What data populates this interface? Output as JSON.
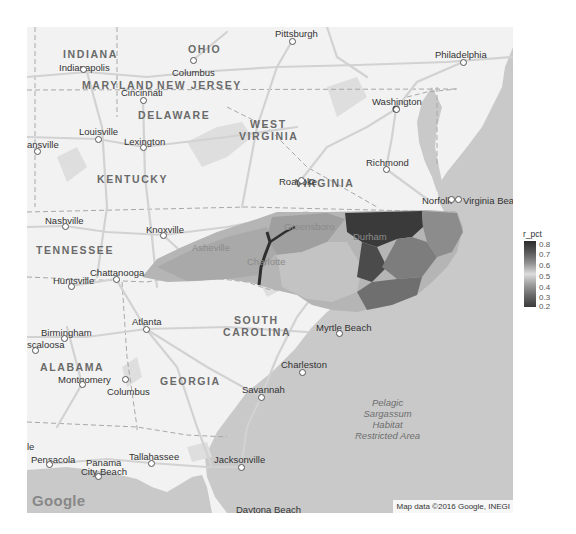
{
  "map": {
    "provider_logo": "Google",
    "attribution": "Map data ©2016 Google, INEGI",
    "ocean_color": "#c9c9c9",
    "land_color": "#f2f2f2",
    "road_color": "#d4d4d4",
    "states": [
      {
        "name": "INDIANA",
        "x": 36,
        "y": 22
      },
      {
        "name": "OHIO",
        "x": 161,
        "y": 17
      },
      {
        "name": "WEST",
        "x": 223,
        "y": 92
      },
      {
        "name": "VIRGINIA",
        "x": 212,
        "y": 104
      },
      {
        "name": "MARYLAND",
        "x": 55,
        "y": 53
      },
      {
        "name": "NEW JERSEY",
        "x": 130,
        "y": 53
      },
      {
        "name": "DELAWARE",
        "x": 111,
        "y": 83
      },
      {
        "name": "KENTUCKY",
        "x": 70,
        "y": 147
      },
      {
        "name": "VIRGINIA",
        "x": 268,
        "y": 151
      },
      {
        "name": "TENNESSEE",
        "x": 9,
        "y": 218
      },
      {
        "name": "SOUTH",
        "x": 207,
        "y": 288
      },
      {
        "name": "CAROLINA",
        "x": 196,
        "y": 300
      },
      {
        "name": "ALABAMA",
        "x": 13,
        "y": 335
      },
      {
        "name": "GEORGIA",
        "x": 133,
        "y": 349
      }
    ],
    "cities": [
      {
        "name": "Pittsburgh",
        "x": 248,
        "y": 2,
        "dot_x": 265,
        "dot_y": 14
      },
      {
        "name": "Indianapolis",
        "x": 32,
        "y": 36,
        "dot_x": 56,
        "dot_y": 42
      },
      {
        "name": "Columbus",
        "x": 145,
        "y": 41,
        "dot_x": 166,
        "dot_y": 33
      },
      {
        "name": "Philadelphia",
        "x": 408,
        "y": 23,
        "dot_x": 436,
        "dot_y": 35
      },
      {
        "name": "Washington",
        "x": 345,
        "y": 70,
        "dot_x": 369,
        "dot_y": 82
      },
      {
        "name": "Cincinnati",
        "x": 94,
        "y": 61,
        "dot_x": 116,
        "dot_y": 73
      },
      {
        "name": "Louisville",
        "x": 52,
        "y": 100,
        "dot_x": 71,
        "dot_y": 112
      },
      {
        "name": "Lexington",
        "x": 97,
        "y": 110,
        "dot_x": 116,
        "dot_y": 120
      },
      {
        "name": "ansville",
        "x": 0,
        "y": 113,
        "dot_x": 10,
        "dot_y": 124
      },
      {
        "name": "Richmond",
        "x": 339,
        "y": 131,
        "dot_x": 359,
        "dot_y": 142
      },
      {
        "name": "Roanoke",
        "x": 252,
        "y": 150,
        "dot_x": 274,
        "dot_y": 153
      },
      {
        "name": "Norfolk",
        "x": 395,
        "y": 169,
        "dot_x": 424,
        "dot_y": 172
      },
      {
        "name": "Virginia Beach",
        "x": 436,
        "y": 169,
        "dot_x": 431,
        "dot_y": 172
      },
      {
        "name": "Nashville",
        "x": 18,
        "y": 189,
        "dot_x": 38,
        "dot_y": 199
      },
      {
        "name": "Knoxville",
        "x": 119,
        "y": 198,
        "dot_x": 136,
        "dot_y": 208
      },
      {
        "name": "Asheville",
        "x": 165,
        "y": 216
      },
      {
        "name": "Greensboro",
        "x": 257,
        "y": 195
      },
      {
        "name": "Durham",
        "x": 326,
        "y": 205
      },
      {
        "name": "Charlotte",
        "x": 220,
        "y": 230
      },
      {
        "name": "Chattanooga",
        "x": 63,
        "y": 241,
        "dot_x": 89,
        "dot_y": 252
      },
      {
        "name": "Huntsville",
        "x": 26,
        "y": 249,
        "dot_x": 44,
        "dot_y": 259
      },
      {
        "name": "Atlanta",
        "x": 105,
        "y": 290,
        "dot_x": 119,
        "dot_y": 302
      },
      {
        "name": "Birmingham",
        "x": 14,
        "y": 301,
        "dot_x": 37,
        "dot_y": 311
      },
      {
        "name": "scaloosa",
        "x": 0,
        "y": 313,
        "dot_x": 8,
        "dot_y": 323
      },
      {
        "name": "Myrtle Beach",
        "x": 289,
        "y": 296,
        "dot_x": 312,
        "dot_y": 306
      },
      {
        "name": "Charleston",
        "x": 254,
        "y": 333,
        "dot_x": 275,
        "dot_y": 345
      },
      {
        "name": "Montgomery",
        "x": 31,
        "y": 348,
        "dot_x": 55,
        "dot_y": 357
      },
      {
        "name": "Columbus",
        "x": 80,
        "y": 360,
        "dot_x": 98,
        "dot_y": 352
      },
      {
        "name": "Savannah",
        "x": 215,
        "y": 358,
        "dot_x": 234,
        "dot_y": 370
      },
      {
        "name": "le",
        "x": 0,
        "y": 415
      },
      {
        "name": "Pensacola",
        "x": 4,
        "y": 428,
        "dot_x": 22,
        "dot_y": 437
      },
      {
        "name": "Panama",
        "x": 59,
        "y": 431
      },
      {
        "name": "City Beach",
        "x": 54,
        "y": 440,
        "dot_x": 71,
        "dot_y": 449
      },
      {
        "name": "Tallahassee",
        "x": 102,
        "y": 425,
        "dot_x": 124,
        "dot_y": 436
      },
      {
        "name": "Jacksonville",
        "x": 187,
        "y": 428,
        "dot_x": 214,
        "dot_y": 440
      },
      {
        "name": "Daytona Beach",
        "x": 209,
        "y": 478
      }
    ],
    "ocean_label": [
      "Pelagic",
      "Sargassum",
      "Habitat",
      "Restricted Area"
    ]
  },
  "legend": {
    "title": "r_pct",
    "ticks": [
      "0.8",
      "0.7",
      "0.6",
      "0.5",
      "0.4",
      "0.3",
      "0.2"
    ],
    "colors": [
      "#2b2b2b",
      "#555555",
      "#8e8e8e",
      "#dcdcdc",
      "#9a9a9a",
      "#676767",
      "#3a3a3a"
    ]
  }
}
